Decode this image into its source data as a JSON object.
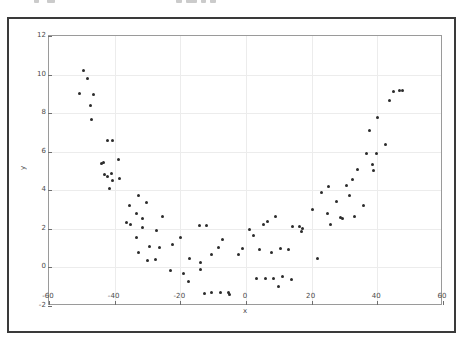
{
  "figure": {
    "background_color": "#ffffff",
    "frame_color": "#3a3a3a",
    "axes_edge_color": "#9a9a9a",
    "grid_color": "#ececec",
    "marker_color": "#2b2b2b",
    "tick_label_color": "#4a4a4a"
  },
  "chart_data": {
    "type": "scatter",
    "title": "",
    "xlabel": "x",
    "ylabel": "y",
    "xlim": [
      -60,
      60
    ],
    "ylim": [
      -2,
      12
    ],
    "xticks": [
      -60,
      -40,
      -20,
      0,
      20,
      40,
      60
    ],
    "yticks": [
      -2,
      0,
      2,
      4,
      6,
      8,
      10,
      12
    ],
    "xticklabels": [
      "-60",
      "-40",
      "-20",
      "0",
      "20",
      "40",
      "60"
    ],
    "yticklabels": [
      "-2",
      "0",
      "2",
      "4",
      "6",
      "8",
      "10",
      "12"
    ],
    "grid": true,
    "legend": null,
    "marker": "circle",
    "marker_size": 3,
    "series": [
      {
        "name": "samples",
        "points": [
          [
            -49.4,
            10.2
          ],
          [
            -48.3,
            9.8
          ],
          [
            -50.6,
            9.0
          ],
          [
            -47.4,
            8.4
          ],
          [
            -46.5,
            8.95
          ],
          [
            -47.0,
            7.65
          ],
          [
            -42.1,
            6.6
          ],
          [
            -40.7,
            6.6
          ],
          [
            -38.9,
            5.6
          ],
          [
            -44.0,
            5.4
          ],
          [
            -43.4,
            5.45
          ],
          [
            -43.1,
            4.8
          ],
          [
            -42.3,
            4.7
          ],
          [
            -41.0,
            4.85
          ],
          [
            -40.6,
            4.5
          ],
          [
            -38.6,
            4.6
          ],
          [
            -41.6,
            4.1
          ],
          [
            -32.8,
            3.75
          ],
          [
            -30.3,
            3.35
          ],
          [
            -35.5,
            3.2
          ],
          [
            -33.4,
            2.8
          ],
          [
            -31.5,
            2.55
          ],
          [
            -25.3,
            2.65
          ],
          [
            -36.3,
            2.35
          ],
          [
            -35.2,
            2.25
          ],
          [
            -31.6,
            2.05
          ],
          [
            -27.4,
            1.9
          ],
          [
            -33.5,
            1.55
          ],
          [
            -19.8,
            1.55
          ],
          [
            -29.4,
            1.1
          ],
          [
            -26.2,
            1.05
          ],
          [
            -22.4,
            1.2
          ],
          [
            -32.8,
            0.75
          ],
          [
            -30.1,
            0.35
          ],
          [
            -27.5,
            0.4
          ],
          [
            -17.3,
            0.45
          ],
          [
            -14.2,
            2.15
          ],
          [
            -12.0,
            2.15
          ],
          [
            -13.9,
            0.25
          ],
          [
            -10.6,
            0.65
          ],
          [
            -8.5,
            1.05
          ],
          [
            -7.3,
            1.45
          ],
          [
            -23.1,
            -0.15
          ],
          [
            -18.9,
            -0.3
          ],
          [
            -17.5,
            -0.75
          ],
          [
            -13.8,
            -0.1
          ],
          [
            -12.5,
            -1.35
          ],
          [
            -10.5,
            -1.3
          ],
          [
            -7.8,
            -1.3
          ],
          [
            -5.3,
            -1.3
          ],
          [
            -4.9,
            -1.4
          ],
          [
            -2.2,
            0.65
          ],
          [
            -1.0,
            1.0
          ],
          [
            1.0,
            1.95
          ],
          [
            2.2,
            1.65
          ],
          [
            4.0,
            0.95
          ],
          [
            5.4,
            2.25
          ],
          [
            6.4,
            2.4
          ],
          [
            8.9,
            2.65
          ],
          [
            7.8,
            0.75
          ],
          [
            10.6,
            1.0
          ],
          [
            12.8,
            0.95
          ],
          [
            3.2,
            -0.55
          ],
          [
            5.8,
            -0.55
          ],
          [
            8.3,
            -0.55
          ],
          [
            9.8,
            -1.0
          ],
          [
            11.2,
            -0.45
          ],
          [
            13.8,
            -0.65
          ],
          [
            14.3,
            2.1
          ],
          [
            16.2,
            2.1
          ],
          [
            16.8,
            1.85
          ],
          [
            17.1,
            2.0
          ],
          [
            20.2,
            3.0
          ],
          [
            21.8,
            0.45
          ],
          [
            23.0,
            3.9
          ],
          [
            24.7,
            2.8
          ],
          [
            25.2,
            4.2
          ],
          [
            25.8,
            2.25
          ],
          [
            27.6,
            3.4
          ],
          [
            28.8,
            2.6
          ],
          [
            29.4,
            2.55
          ],
          [
            30.5,
            4.25
          ],
          [
            31.6,
            3.75
          ],
          [
            32.4,
            4.55
          ],
          [
            32.9,
            2.65
          ],
          [
            33.9,
            5.1
          ],
          [
            35.9,
            3.2
          ],
          [
            36.6,
            5.9
          ],
          [
            37.5,
            7.1
          ],
          [
            38.8,
            5.05
          ],
          [
            38.5,
            5.35
          ],
          [
            39.8,
            5.9
          ],
          [
            40.1,
            7.8
          ],
          [
            42.5,
            6.4
          ],
          [
            43.6,
            8.65
          ],
          [
            44.8,
            9.1
          ],
          [
            46.9,
            9.15
          ],
          [
            47.7,
            9.15
          ]
        ]
      }
    ]
  }
}
